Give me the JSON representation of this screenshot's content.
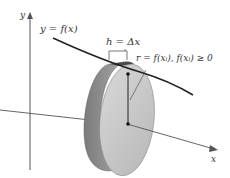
{
  "diagram": {
    "labels": {
      "y_axis": "y",
      "x_axis": "x",
      "curve": "y = f(x)",
      "thickness": "h = Δx",
      "radius": "r = f(xᵢ), f(xᵢ) ≥ 0"
    },
    "colors": {
      "axis": "#555555",
      "curve": "#222222",
      "disk_face": "#c8c8c8",
      "disk_side": "#8a8a8a",
      "disk_top": "#4a4a4a"
    }
  }
}
